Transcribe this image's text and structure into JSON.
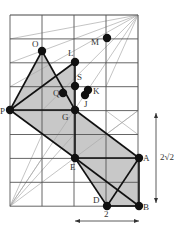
{
  "diagram": {
    "grid": {
      "x0": 10,
      "y0": 15,
      "cols": 4,
      "rows": 8,
      "cell_w": 32,
      "cell_h": 23.9
    },
    "colors": {
      "grid": "#555555",
      "thin": "#aaaaaa",
      "shade": "#c8c8c8",
      "bold": "#111111"
    },
    "points": [
      {
        "id": "O",
        "x": 42,
        "y": 51,
        "lx": 32,
        "ly": 47
      },
      {
        "id": "M",
        "x": 107,
        "y": 38,
        "lx": 91,
        "ly": 45
      },
      {
        "id": "L",
        "x": 75,
        "y": 62,
        "lx": 68,
        "ly": 56
      },
      {
        "id": "S",
        "x": 75,
        "y": 86,
        "lx": 77,
        "ly": 80
      },
      {
        "id": "Q",
        "x": 63,
        "y": 93,
        "lx": 53,
        "ly": 96
      },
      {
        "id": "K",
        "x": 88,
        "y": 90,
        "lx": 93,
        "ly": 94
      },
      {
        "id": "J",
        "x": 85,
        "y": 95,
        "lx": 84,
        "ly": 107
      },
      {
        "id": "G",
        "x": 75,
        "y": 110,
        "lx": 62,
        "ly": 120
      },
      {
        "id": "P",
        "x": 10,
        "y": 110,
        "lx": 0,
        "ly": 114
      },
      {
        "id": "E",
        "x": 75,
        "y": 158,
        "lx": 70,
        "ly": 170
      },
      {
        "id": "A",
        "x": 139,
        "y": 158,
        "lx": 143,
        "ly": 161
      },
      {
        "id": "D",
        "x": 107,
        "y": 206,
        "lx": 93,
        "ly": 203
      },
      {
        "id": "B",
        "x": 139,
        "y": 206,
        "lx": 143,
        "ly": 210
      }
    ],
    "measure_vertical": {
      "label": "2√2",
      "x": 156,
      "y1": 113,
      "y2": 203,
      "lx": 160,
      "ly": 160
    },
    "measure_horizontal": {
      "label": "2",
      "x1": 75,
      "x2": 139,
      "y": 221,
      "lx": 104,
      "ly": 217
    }
  }
}
